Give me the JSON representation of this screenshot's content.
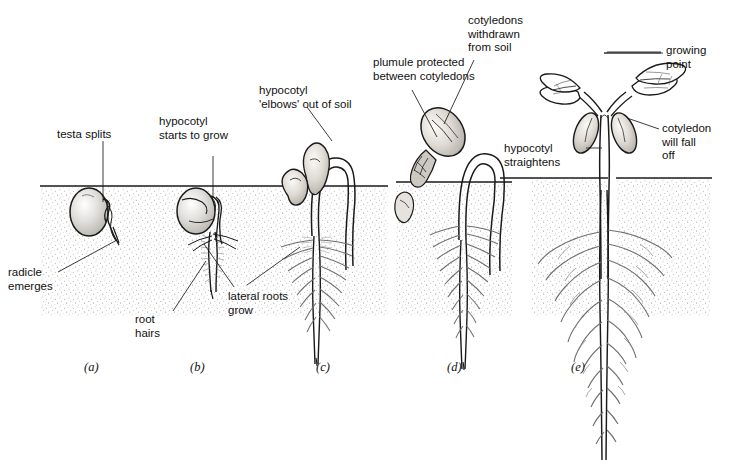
{
  "figure": {
    "soil_line_color": "#1a1a1a",
    "ink_color": "#1a1a1a",
    "soil_stipple_color": "#9a9a9a",
    "background": "#ffffff"
  },
  "labels": {
    "testa_splits": "testa splits",
    "radicle_emerges": "radicle\nemerges",
    "hypocotyl_starts": "hypocotyl\nstarts to grow",
    "root_hairs": "root\nhairs",
    "lateral_roots": "lateral roots\ngrow",
    "hypocotyl_elbows": "hypocotyl\n'elbows' out of soil",
    "plumule_protected": "plumule protected\nbetween cotyledons",
    "cotyledons_withdrawn": "cotyledons\nwithdrawn\nfrom soil",
    "growing_point": "growing\npoint",
    "cotyledon_will_fall": "cotyledon\nwill fall\noff",
    "hypocotyl_straightens": "hypocotyl\nstraightens"
  },
  "stages": [
    {
      "key": "a",
      "caption": "(a)",
      "description": "testa splits, radicle emerges"
    },
    {
      "key": "b",
      "caption": "(b)",
      "description": "hypocotyl starts to grow, root hairs form"
    },
    {
      "key": "c",
      "caption": "(c)",
      "description": "hypocotyl elbows out of soil, lateral roots grow"
    },
    {
      "key": "d",
      "caption": "(d)",
      "description": "cotyledons withdrawn from soil, plumule protected"
    },
    {
      "key": "e",
      "caption": "(e)",
      "description": "hypocotyl straightens, cotyledon will fall off"
    }
  ]
}
